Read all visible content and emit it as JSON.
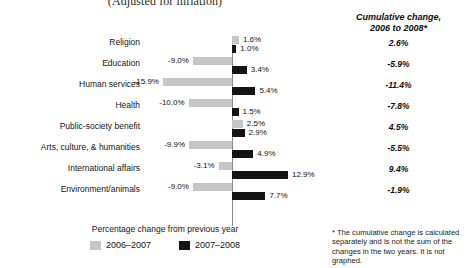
{
  "chart_data": {
    "type": "bar",
    "title": "(Adjusted for inflation)",
    "xlabel": "Percentage change from previous year",
    "ylabel": "",
    "orientation": "horizontal",
    "grid": false,
    "zero_axis": true,
    "xlim": [
      -18,
      16
    ],
    "legend_position": "bottom",
    "categories": [
      "Religion",
      "Education",
      "Human services",
      "Health",
      "Public-society benefit",
      "Arts, culture, & humanities",
      "International affairs",
      "Environment/animals"
    ],
    "series": [
      {
        "name": "2006–2007",
        "color": "#c6c6c6",
        "values": [
          1.6,
          -9.0,
          -15.9,
          -10.0,
          2.5,
          -9.9,
          -3.1,
          -9.0
        ],
        "labels": [
          "1.6%",
          "-9.0%",
          "-15.9%",
          "-10.0%",
          "2.5%",
          "-9.9%",
          "-3.1%",
          "-9.0%"
        ]
      },
      {
        "name": "2007–2008",
        "color": "#141414",
        "values": [
          1.0,
          3.4,
          5.4,
          1.5,
          2.9,
          4.9,
          12.9,
          7.7
        ],
        "labels": [
          "1.0%",
          "3.4%",
          "5.4%",
          "1.5%",
          "2.9%",
          "4.9%",
          "12.9%",
          "7.7%"
        ]
      }
    ],
    "annotations": {
      "cumulative_header": "Cumulative change,\n2006 to 2008*",
      "cumulative_values": [
        "2.6%",
        "-5.9%",
        "-11.4%",
        "-7.8%",
        "4.5%",
        "-5.5%",
        "9.4%",
        "-1.9%"
      ],
      "footnote": "* The cumulative change is calculated separately and is not the sum of the changes in the two years. It is not graphed."
    }
  },
  "header": {
    "title": "(Adjusted for inflation)",
    "cumulative_line1": "Cumulative change,",
    "cumulative_line2": "2006 to 2008*"
  },
  "rows": [
    {
      "category": "Religion",
      "gray_label": "1.6%",
      "black_label": "1.0%",
      "cumulative": "2.6%"
    },
    {
      "category": "Education",
      "gray_label": "-9.0%",
      "black_label": "3.4%",
      "cumulative": "-5.9%"
    },
    {
      "category": "Human services",
      "gray_label": "-15.9%",
      "black_label": "5.4%",
      "cumulative": "-11.4%"
    },
    {
      "category": "Health",
      "gray_label": "-10.0%",
      "black_label": "1.5%",
      "cumulative": "-7.8%"
    },
    {
      "category": "Public-society benefit",
      "gray_label": "2.5%",
      "black_label": "2.9%",
      "cumulative": "4.5%"
    },
    {
      "category": "Arts, culture, & humanities",
      "gray_label": "-9.9%",
      "black_label": "4.9%",
      "cumulative": "-5.5%"
    },
    {
      "category": "International affairs",
      "gray_label": "-3.1%",
      "black_label": "12.9%",
      "cumulative": "9.4%"
    },
    {
      "category": "Environment/animals",
      "gray_label": "-9.0%",
      "black_label": "7.7%",
      "cumulative": "-1.9%"
    }
  ],
  "legend": {
    "axis_caption": "Percentage change from previous year",
    "items": [
      {
        "label": "2006–2007",
        "color": "#c6c6c6"
      },
      {
        "label": "2007–2008",
        "color": "#141414"
      }
    ]
  },
  "footnote": {
    "text": "* The cumulative change is calculated separately and is not the sum of the changes in the two years. It is not graphed."
  }
}
